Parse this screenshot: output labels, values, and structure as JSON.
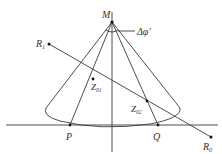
{
  "diagram": {
    "colors": {
      "line": "#3a3a3a",
      "point": "#111111",
      "label": "#333333",
      "background": "#ffffff"
    },
    "points": {
      "M": {
        "label": "M",
        "x": 112,
        "y": 22
      },
      "R1": {
        "label": "R",
        "sub": "1",
        "x": 49,
        "y": 44
      },
      "R0": {
        "label": "R",
        "sub": "0",
        "x": 211,
        "y": 137
      },
      "Z01": {
        "label": "Z",
        "sub": "01",
        "x": 93,
        "y": 79
      },
      "Z02": {
        "label": "Z",
        "sub": "02",
        "x": 147,
        "y": 101
      },
      "P": {
        "label": "P",
        "x": 70,
        "y": 125
      },
      "Q": {
        "label": "Q",
        "x": 158,
        "y": 125
      }
    },
    "angle_label": {
      "text": "Δφ'",
      "symbol": "Δ",
      "var": "φ'"
    },
    "labels": {
      "M": "M",
      "R1_main": "R",
      "R1_sub": "1",
      "R0_main": "R",
      "R0_sub": "0",
      "Z01_main": "Z",
      "Z01_sub": "01",
      "Z02_main": "Z",
      "Z02_sub": "02",
      "P": "P",
      "Q": "Q",
      "delta_phi": "Δφ'"
    }
  }
}
